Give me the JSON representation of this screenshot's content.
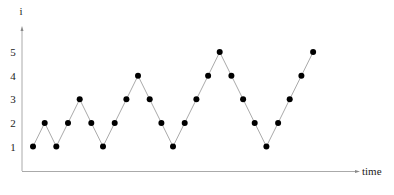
{
  "chart_data": {
    "type": "line",
    "title": "",
    "xlabel": "time",
    "ylabel": "i",
    "x": [
      1,
      2,
      3,
      4,
      5,
      6,
      7,
      8,
      9,
      10,
      11,
      12,
      13,
      14,
      15,
      16,
      17,
      18,
      19,
      20,
      21,
      22,
      23,
      24,
      25
    ],
    "series": [
      {
        "name": "i",
        "values": [
          1,
          2,
          1,
          2,
          3,
          2,
          1,
          2,
          3,
          4,
          3,
          2,
          1,
          2,
          3,
          4,
          5,
          4,
          3,
          2,
          1,
          2,
          3,
          4,
          5
        ]
      }
    ],
    "yticks": [
      "1",
      "2",
      "3",
      "4",
      "5"
    ],
    "ylim": [
      0,
      5.5
    ],
    "grid": false,
    "legend": "none",
    "markers": "filled-circle",
    "colors": {
      "line": "#aaaaaa",
      "marker": "#000000",
      "axis": "#999999"
    }
  }
}
